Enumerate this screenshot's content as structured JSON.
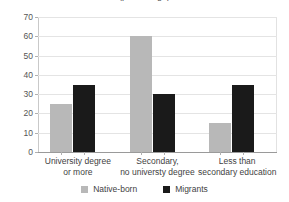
{
  "chart_data": {
    "type": "bar",
    "title": "(percentage)",
    "xlabel": "",
    "ylabel": "",
    "ylim": [
      0,
      70
    ],
    "ytick_step": 10,
    "yticks": [
      70,
      60,
      50,
      40,
      30,
      20,
      10,
      0
    ],
    "grid": true,
    "legend_position": "bottom-center",
    "categories": [
      "University degree\nor more",
      "Secondary,\nno universty degree",
      "Less than\nsecondary education"
    ],
    "categories_flat": [
      [
        "University degree",
        "or more"
      ],
      [
        "Secondary,",
        "no universty degree"
      ],
      [
        "Less than",
        "secondary education"
      ]
    ],
    "series": [
      {
        "name": "Native-born",
        "color": "#b8b8b8",
        "values": [
          25,
          60,
          15
        ]
      },
      {
        "name": "Migrants",
        "color": "#1a1a1a",
        "values": [
          35,
          30,
          35
        ]
      }
    ]
  },
  "legend": {
    "items": [
      {
        "label": "Native-born",
        "color": "#b8b8b8"
      },
      {
        "label": "Migrants",
        "color": "#1a1a1a"
      }
    ]
  }
}
